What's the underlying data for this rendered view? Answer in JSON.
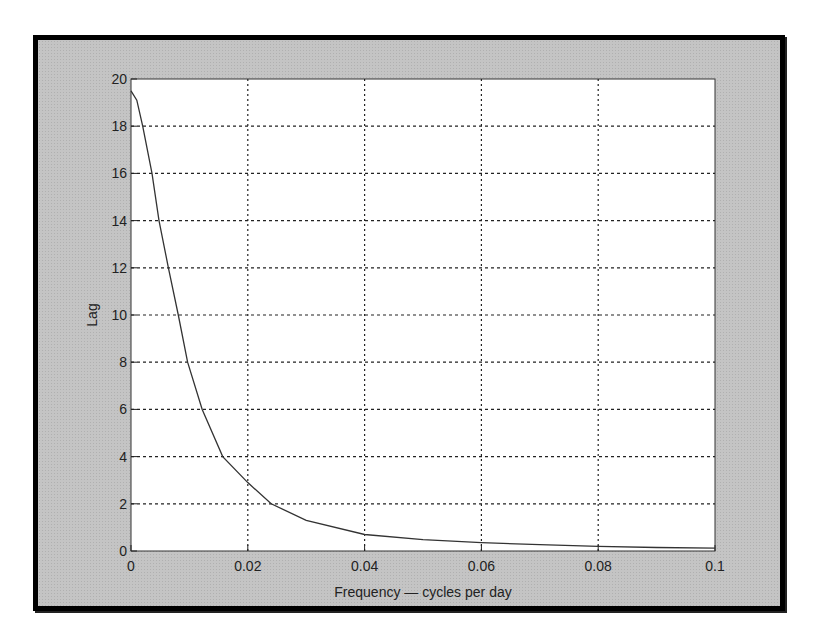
{
  "chart_data": {
    "type": "line",
    "title": "",
    "xlabel": "Frequency — cycles per day",
    "ylabel": "Lag",
    "xlim": [
      0,
      0.1
    ],
    "ylim": [
      0,
      20
    ],
    "grid": true,
    "x_ticks": [
      "0",
      "0.02",
      "0.04",
      "0.06",
      "0.08",
      "0.1"
    ],
    "y_ticks": [
      "0",
      "2",
      "4",
      "6",
      "8",
      "10",
      "12",
      "14",
      "16",
      "18",
      "20"
    ],
    "series": [
      {
        "name": "Lag",
        "color": "#333333",
        "x": [
          0,
          0.001,
          0.002,
          0.0036,
          0.0048,
          0.0064,
          0.0081,
          0.0097,
          0.0122,
          0.0157,
          0.02,
          0.024,
          0.03,
          0.04,
          0.05,
          0.06,
          0.07,
          0.08,
          0.09,
          0.1
        ],
        "y": [
          19.5,
          19.1,
          18,
          16,
          14,
          12,
          10,
          8,
          6,
          4,
          2.9,
          2.0,
          1.3,
          0.7,
          0.48,
          0.35,
          0.27,
          0.2,
          0.15,
          0.12
        ]
      }
    ]
  },
  "plot": {
    "x_ticks": [
      {
        "v": 0,
        "label": "0"
      },
      {
        "v": 0.02,
        "label": "0.02"
      },
      {
        "v": 0.04,
        "label": "0.04"
      },
      {
        "v": 0.06,
        "label": "0.06"
      },
      {
        "v": 0.08,
        "label": "0.08"
      },
      {
        "v": 0.1,
        "label": "0.1"
      }
    ],
    "y_ticks": [
      {
        "v": 0,
        "label": "0"
      },
      {
        "v": 2,
        "label": "2"
      },
      {
        "v": 4,
        "label": "4"
      },
      {
        "v": 6,
        "label": "6"
      },
      {
        "v": 8,
        "label": "8"
      },
      {
        "v": 10,
        "label": "10"
      },
      {
        "v": 12,
        "label": "12"
      },
      {
        "v": 14,
        "label": "14"
      },
      {
        "v": 16,
        "label": "16"
      },
      {
        "v": 18,
        "label": "18"
      },
      {
        "v": 20,
        "label": "20"
      }
    ]
  }
}
